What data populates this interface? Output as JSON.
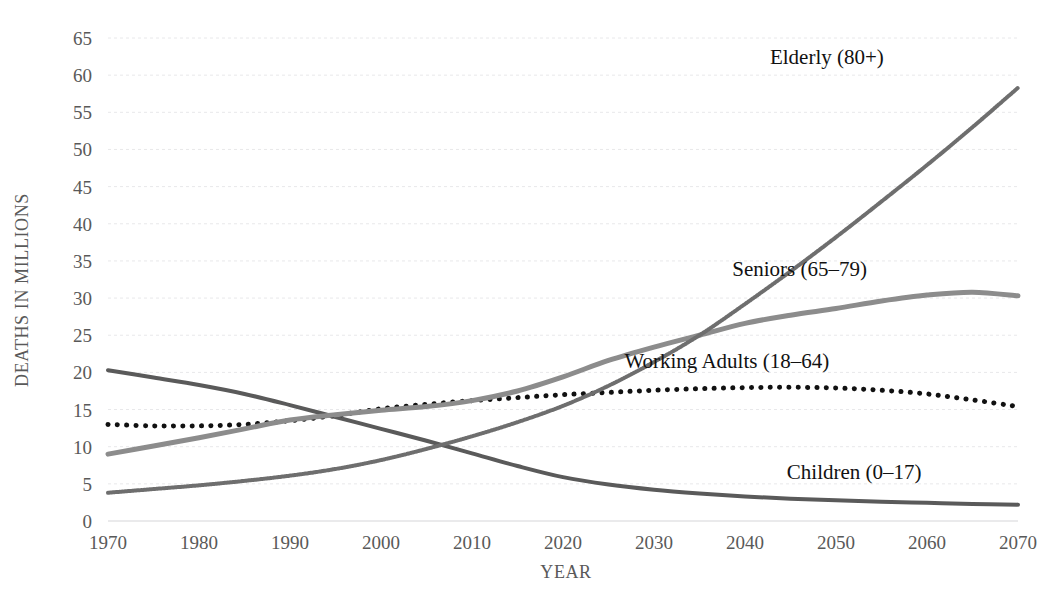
{
  "chart_data": {
    "type": "line",
    "title": "",
    "xlabel": "YEAR",
    "ylabel": "DEATHS IN MILLIONS",
    "xlim": [
      1970,
      2070
    ],
    "ylim": [
      0,
      65
    ],
    "ytick_step": 5,
    "grid": true,
    "legend": "inline-right-labels",
    "xticks": [
      "1970",
      "1980",
      "1990",
      "2000",
      "2010",
      "2020",
      "2030",
      "2040",
      "2050",
      "2060",
      "2070"
    ],
    "yticks": [
      "0",
      "5",
      "10",
      "15",
      "20",
      "25",
      "30",
      "35",
      "40",
      "45",
      "50",
      "55",
      "60",
      "65"
    ],
    "x": [
      1970,
      1975,
      1980,
      1985,
      1990,
      1995,
      2000,
      2005,
      2010,
      2015,
      2020,
      2025,
      2030,
      2035,
      2040,
      2045,
      2050,
      2055,
      2060,
      2065,
      2070
    ],
    "series": [
      {
        "name": "Children (0–17)",
        "label": "Children (0–17)",
        "style": "solid",
        "color": "#5a5a5a",
        "width": 4,
        "label_x": 2052,
        "label_y": 5.6,
        "values": [
          20.3,
          19.3,
          18.3,
          17.1,
          15.6,
          14.0,
          12.4,
          10.8,
          9.1,
          7.4,
          5.9,
          4.9,
          4.2,
          3.7,
          3.3,
          3.0,
          2.8,
          2.6,
          2.45,
          2.3,
          2.2
        ]
      },
      {
        "name": "Working Adults (18–64)",
        "label": "Working Adults (18–64)",
        "style": "dotted",
        "color": "#111111",
        "width": 5,
        "label_x": 2038,
        "label_y": 20.6,
        "values": [
          13.0,
          12.8,
          12.8,
          13.0,
          13.5,
          14.2,
          15.1,
          15.7,
          16.2,
          16.6,
          17.0,
          17.3,
          17.6,
          17.8,
          17.95,
          18.0,
          17.9,
          17.6,
          17.1,
          16.3,
          15.4
        ]
      },
      {
        "name": "Seniors (65–79)",
        "label": "Seniors (65–79)",
        "style": "solid",
        "color": "#8c8c8c",
        "width": 5,
        "label_x": 2046,
        "label_y": 33.0,
        "values": [
          9.0,
          10.1,
          11.2,
          12.4,
          13.6,
          14.3,
          14.9,
          15.4,
          16.2,
          17.5,
          19.4,
          21.6,
          23.4,
          25.0,
          26.6,
          27.7,
          28.6,
          29.6,
          30.4,
          30.8,
          30.3
        ]
      },
      {
        "name": "Elderly (80+)",
        "label": "Elderly (80+)",
        "style": "hatched",
        "color": "#6e6e6e",
        "width": 4,
        "label_x": 2049,
        "label_y": 61.5,
        "values": [
          3.8,
          4.3,
          4.8,
          5.4,
          6.1,
          7.0,
          8.2,
          9.7,
          11.4,
          13.3,
          15.5,
          18.2,
          21.4,
          25.0,
          29.2,
          33.6,
          38.2,
          43.0,
          47.9,
          53.0,
          58.3
        ]
      }
    ]
  }
}
